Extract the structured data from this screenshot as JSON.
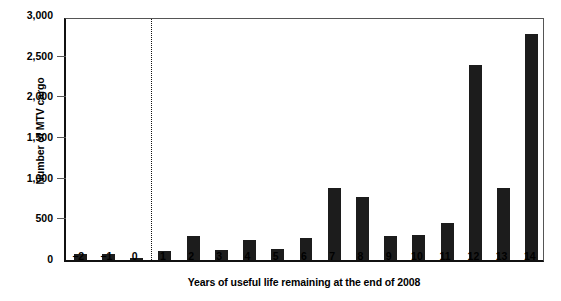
{
  "chart_data": {
    "type": "bar",
    "title": "",
    "xlabel": "Years of useful life remaining at the end of 2008",
    "ylabel": "Number of MTV cargo",
    "categories": [
      "−2",
      "−1",
      "0",
      "1",
      "2",
      "3",
      "4",
      "5",
      "6",
      "7",
      "8",
      "9",
      "10",
      "11",
      "12",
      "13",
      "14"
    ],
    "values": [
      70,
      75,
      25,
      110,
      300,
      120,
      250,
      135,
      275,
      890,
      780,
      290,
      310,
      450,
      2400,
      880,
      2780
    ],
    "ylim": [
      0,
      3000
    ],
    "ytick_values": [
      0,
      500,
      1000,
      1500,
      2000,
      2500,
      3000
    ],
    "ytick_labels": [
      "0",
      "500",
      "1,000",
      "1,500",
      "2,000",
      "2,500",
      "3,000"
    ],
    "grid": false,
    "legend": null,
    "bar_color": "#1c1c1c",
    "annotations": [
      {
        "name": "zero-divider",
        "type": "vertical-dotted-line",
        "between_categories": [
          "0",
          "1"
        ]
      }
    ]
  }
}
